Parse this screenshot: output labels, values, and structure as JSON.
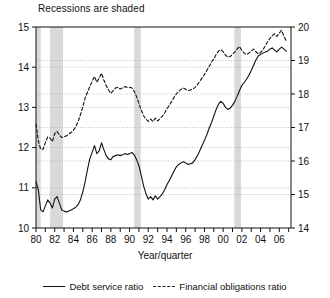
{
  "annotation": {
    "recessions_note": "Recessions are shaded"
  },
  "axis": {
    "xlabel": "Year/quarter",
    "left_ticks": [
      "10",
      "11",
      "12",
      "13",
      "14",
      "15"
    ],
    "right_ticks": [
      "14",
      "15",
      "16",
      "17",
      "18",
      "19",
      "20"
    ],
    "x_ticks": [
      "80",
      "82",
      "84",
      "86",
      "88",
      "90",
      "92",
      "94",
      "96",
      "98",
      "00",
      "02",
      "04",
      "06"
    ]
  },
  "legend": {
    "position": "bottom-center",
    "entries": [
      {
        "label": "Debt service ratio",
        "style": "solid",
        "axis": "left"
      },
      {
        "label": "Financial obligations ratio",
        "style": "dashed",
        "axis": "right"
      }
    ]
  },
  "colors": {
    "line": "#111111",
    "recession_band": "#d9d9d9",
    "grid": "#9a9a9a",
    "frame": "#111111",
    "background": "#ffffff"
  },
  "chart_data": {
    "type": "line",
    "title": "",
    "subtitle": "",
    "xlabel": "Year/quarter",
    "ylabel": "",
    "grid": true,
    "x_start": 1980.0,
    "x_end": 2007.0,
    "x_step": 0.25,
    "xlim": [
      1980.0,
      2007.25
    ],
    "left_ylim": [
      10,
      15
    ],
    "right_ylim": [
      14,
      20
    ],
    "left_ticks": [
      10,
      11,
      12,
      13,
      14,
      15
    ],
    "right_ticks": [
      14,
      15,
      16,
      17,
      18,
      19,
      20
    ],
    "x_tick_values": [
      1980,
      1982,
      1984,
      1986,
      1988,
      1990,
      1992,
      1994,
      1996,
      1998,
      2000,
      2002,
      2004,
      2006
    ],
    "x_tick_labels": [
      "80",
      "82",
      "84",
      "86",
      "88",
      "90",
      "92",
      "94",
      "96",
      "98",
      "00",
      "02",
      "04",
      "06"
    ],
    "recessions": [
      {
        "start": 1980.0,
        "end": 1980.5
      },
      {
        "start": 1981.5,
        "end": 1982.9
      },
      {
        "start": 1990.5,
        "end": 1991.2
      },
      {
        "start": 2001.2,
        "end": 2001.9
      }
    ],
    "series": [
      {
        "name": "Debt service ratio",
        "axis": "left",
        "style": "solid",
        "values": [
          11.15,
          10.95,
          10.45,
          10.4,
          10.55,
          10.7,
          10.62,
          10.5,
          10.72,
          10.78,
          10.62,
          10.45,
          10.42,
          10.4,
          10.42,
          10.45,
          10.48,
          10.52,
          10.58,
          10.7,
          10.9,
          11.15,
          11.45,
          11.72,
          11.88,
          12.05,
          11.85,
          11.92,
          12.12,
          11.95,
          11.8,
          11.72,
          11.7,
          11.78,
          11.8,
          11.82,
          11.8,
          11.82,
          11.85,
          11.83,
          11.85,
          11.88,
          11.82,
          11.7,
          11.55,
          11.3,
          11.05,
          10.85,
          10.72,
          10.78,
          10.7,
          10.8,
          10.72,
          10.78,
          10.85,
          10.95,
          11.08,
          11.18,
          11.3,
          11.42,
          11.52,
          11.58,
          11.62,
          11.65,
          11.62,
          11.58,
          11.6,
          11.62,
          11.7,
          11.8,
          11.92,
          12.05,
          12.18,
          12.32,
          12.48,
          12.62,
          12.78,
          12.95,
          13.08,
          13.15,
          13.1,
          13.0,
          12.95,
          12.98,
          13.05,
          13.15,
          13.28,
          13.42,
          13.55,
          13.62,
          13.7,
          13.8,
          13.92,
          14.05,
          14.18,
          14.28,
          14.32,
          14.35,
          14.38,
          14.4,
          14.45,
          14.48,
          14.42,
          14.38,
          14.45,
          14.5,
          14.45,
          14.4
        ]
      },
      {
        "name": "Financial obligations ratio",
        "axis": "right",
        "style": "dashed",
        "values": [
          17.1,
          16.6,
          16.35,
          16.35,
          16.55,
          16.72,
          16.68,
          16.58,
          16.82,
          16.88,
          16.78,
          16.7,
          16.72,
          16.75,
          16.8,
          16.85,
          16.92,
          17.02,
          17.18,
          17.38,
          17.62,
          17.88,
          18.05,
          18.22,
          18.38,
          18.52,
          18.35,
          18.48,
          18.62,
          18.42,
          18.25,
          18.12,
          18.02,
          18.1,
          18.18,
          18.2,
          18.15,
          18.18,
          18.22,
          18.2,
          18.2,
          18.18,
          18.08,
          17.92,
          17.72,
          17.52,
          17.35,
          17.25,
          17.18,
          17.25,
          17.18,
          17.28,
          17.2,
          17.26,
          17.34,
          17.44,
          17.56,
          17.66,
          17.78,
          17.9,
          18.0,
          18.08,
          18.14,
          18.18,
          18.14,
          18.1,
          18.12,
          18.14,
          18.2,
          18.28,
          18.38,
          18.48,
          18.58,
          18.7,
          18.82,
          18.95,
          19.05,
          19.18,
          19.28,
          19.32,
          19.26,
          19.16,
          19.1,
          19.12,
          19.18,
          19.26,
          19.34,
          19.42,
          19.3,
          19.22,
          19.18,
          19.22,
          19.28,
          19.34,
          19.26,
          19.2,
          19.24,
          19.32,
          19.44,
          19.56,
          19.66,
          19.74,
          19.8,
          19.72,
          19.82,
          19.9,
          19.72,
          19.58
        ]
      }
    ]
  }
}
